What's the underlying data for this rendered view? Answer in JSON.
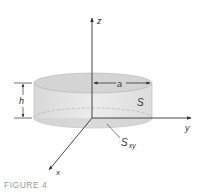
{
  "figure": {
    "caption": "FIGURE 4",
    "labels": {
      "z_axis": "z",
      "y_axis": "y",
      "x_axis": "x",
      "radius": "a",
      "height": "h",
      "surface": "S",
      "projection_main": "S",
      "projection_sub": "xy"
    },
    "colors": {
      "cylinder_side": "#e6e6e6",
      "cylinder_top": "#d2d2d2",
      "cylinder_bottom": "#cfcfcf",
      "line": "#333333",
      "caption": "#9a9a9a"
    }
  }
}
